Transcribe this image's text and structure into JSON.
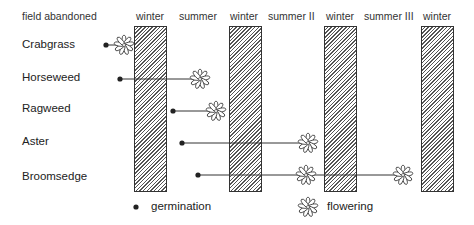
{
  "header": {
    "field_abandoned": "field abandoned",
    "seasons": [
      "winter",
      "summer",
      "winter",
      "summer II",
      "winter",
      "summer III",
      "winter"
    ]
  },
  "species": [
    {
      "name": "Crabgrass",
      "germination": "field abandoned",
      "flowering": [
        "winter (start)"
      ]
    },
    {
      "name": "Horseweed",
      "germination": "field abandoned",
      "flowering": [
        "summer"
      ]
    },
    {
      "name": "Ragweed",
      "germination": "summer",
      "flowering": [
        "summer"
      ]
    },
    {
      "name": "Aster",
      "germination": "summer",
      "flowering": [
        "summer II"
      ]
    },
    {
      "name": "Broomsedge",
      "germination": "summer",
      "flowering": [
        "summer II",
        "summer III"
      ]
    }
  ],
  "legend": {
    "germination": "germination",
    "flowering": "flowering"
  }
}
